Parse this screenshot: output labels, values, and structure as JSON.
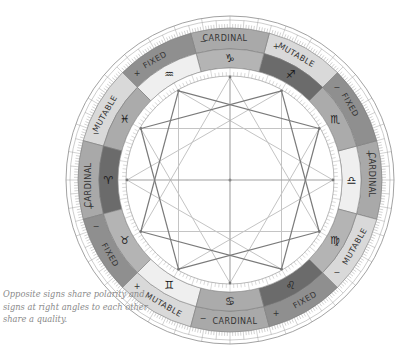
{
  "caption": "Opposite signs share polarity and signs at right angles to each other share a quality.",
  "wheel": {
    "center": [
      230,
      180
    ],
    "radii": {
      "outer": 164,
      "tick_outer_inner": 152,
      "quality_inner": 131,
      "sign_inner": 112,
      "inner_circle": 104
    },
    "signs": [
      {
        "name": "Libra",
        "glyph": "♎",
        "angle": 0,
        "fill": "#efefef"
      },
      {
        "name": "Scorpio",
        "glyph": "♏",
        "angle": 30,
        "fill": "#ababab"
      },
      {
        "name": "Sagittarius",
        "glyph": "♐",
        "angle": 60,
        "fill": "#6b6b6b"
      },
      {
        "name": "Capricorn",
        "glyph": "♑",
        "angle": 90,
        "fill": "#b4b4b4"
      },
      {
        "name": "Aquarius",
        "glyph": "♒",
        "angle": 120,
        "fill": "#efefef"
      },
      {
        "name": "Pisces",
        "glyph": "♓",
        "angle": 150,
        "fill": "#ababab"
      },
      {
        "name": "Aries",
        "glyph": "♈",
        "angle": 180,
        "fill": "#6b6b6b"
      },
      {
        "name": "Taurus",
        "glyph": "♉",
        "angle": 210,
        "fill": "#b4b4b4"
      },
      {
        "name": "Gemini",
        "glyph": "♊",
        "angle": 240,
        "fill": "#efefef"
      },
      {
        "name": "Cancer",
        "glyph": "♋",
        "angle": 270,
        "fill": "#ababab"
      },
      {
        "name": "Leo",
        "glyph": "♌",
        "angle": 300,
        "fill": "#6b6b6b"
      },
      {
        "name": "Virgo",
        "glyph": "♍",
        "angle": 330,
        "fill": "#b4b4b4"
      }
    ],
    "qualities": [
      {
        "label": "CARDINAL",
        "polarity": "+",
        "angle": 0,
        "fill": "#a9a9a9"
      },
      {
        "label": "FIXED",
        "polarity": "−",
        "angle": 30,
        "fill": "#8f8f8f"
      },
      {
        "label": "MUTABLE",
        "polarity": "+",
        "angle": 60,
        "fill": "#d9d9d9"
      },
      {
        "label": "CARDINAL",
        "polarity": "−",
        "angle": 90,
        "fill": "#a9a9a9"
      },
      {
        "label": "FIXED",
        "polarity": "+",
        "angle": 120,
        "fill": "#8f8f8f"
      },
      {
        "label": "MUTABLE",
        "polarity": "−",
        "angle": 150,
        "fill": "#d9d9d9"
      },
      {
        "label": "CARDINAL",
        "polarity": "+",
        "angle": 180,
        "fill": "#a9a9a9"
      },
      {
        "label": "FIXED",
        "polarity": "−",
        "angle": 210,
        "fill": "#8f8f8f"
      },
      {
        "label": "MUTABLE",
        "polarity": "+",
        "angle": 240,
        "fill": "#d9d9d9"
      },
      {
        "label": "CARDINAL",
        "polarity": "−",
        "angle": 270,
        "fill": "#a9a9a9"
      },
      {
        "label": "FIXED",
        "polarity": "+",
        "angle": 300,
        "fill": "#8f8f8f"
      },
      {
        "label": "MUTABLE",
        "polarity": "−",
        "angle": 330,
        "fill": "#d9d9d9"
      }
    ],
    "lines": {
      "square_color": "#7a7a7a",
      "trine_color": "#c4c4c4",
      "cross_color": "#a0a0a0"
    }
  }
}
